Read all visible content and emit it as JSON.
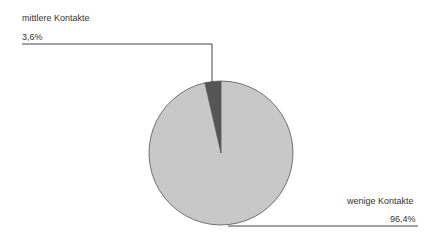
{
  "chart_data": {
    "type": "pie",
    "title": "",
    "slices": [
      {
        "label": "mittlere Kontakte",
        "value": 3.6,
        "display": "3,6%",
        "color": "#555555"
      },
      {
        "label": "wenige Kontakte",
        "value": 96.4,
        "display": "96,4%",
        "color": "#c8c8c8"
      }
    ],
    "legend": "none (callout labels)"
  },
  "labels": {
    "mittlere_name": "mittlere Kontakte",
    "mittlere_value": "3,6%",
    "wenige_name": "wenige Kontakte",
    "wenige_value": "96,4%"
  }
}
